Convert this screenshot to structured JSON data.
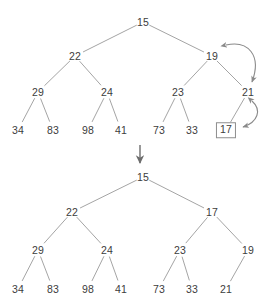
{
  "figure": {
    "background_color": "#ffffff",
    "edge_color": "#9a9a9a",
    "text_color": "#3c3c3c",
    "arrow_color": "#8a8a8a",
    "box_border_color": "#8e8e8e"
  },
  "trees": [
    {
      "id": "before",
      "name": "upper-tree",
      "nodes": [
        {
          "id": "u0",
          "label": "15",
          "x": 143,
          "y": 22,
          "level": 0,
          "boxed": false
        },
        {
          "id": "u1",
          "label": "22",
          "x": 75,
          "y": 56,
          "level": 1,
          "boxed": false
        },
        {
          "id": "u2",
          "label": "19",
          "x": 212,
          "y": 56,
          "level": 1,
          "boxed": false
        },
        {
          "id": "u3",
          "label": "29",
          "x": 38,
          "y": 92,
          "level": 2,
          "boxed": false
        },
        {
          "id": "u4",
          "label": "24",
          "x": 107,
          "y": 92,
          "level": 2,
          "boxed": false
        },
        {
          "id": "u5",
          "label": "23",
          "x": 178,
          "y": 92,
          "level": 2,
          "boxed": false
        },
        {
          "id": "u6",
          "label": "21",
          "x": 248,
          "y": 92,
          "level": 2,
          "boxed": false
        },
        {
          "id": "u7",
          "label": "34",
          "x": 18,
          "y": 130,
          "level": 3,
          "boxed": false
        },
        {
          "id": "u8",
          "label": "83",
          "x": 53,
          "y": 130,
          "level": 3,
          "boxed": false
        },
        {
          "id": "u9",
          "label": "98",
          "x": 88,
          "y": 130,
          "level": 3,
          "boxed": false
        },
        {
          "id": "u10",
          "label": "41",
          "x": 121,
          "y": 130,
          "level": 3,
          "boxed": false
        },
        {
          "id": "u11",
          "label": "73",
          "x": 159,
          "y": 130,
          "level": 3,
          "boxed": false
        },
        {
          "id": "u12",
          "label": "33",
          "x": 192,
          "y": 130,
          "level": 3,
          "boxed": false
        },
        {
          "id": "u13",
          "label": "17",
          "x": 226,
          "y": 130,
          "level": 3,
          "boxed": true
        }
      ],
      "edges": [
        [
          "u0",
          "u1"
        ],
        [
          "u0",
          "u2"
        ],
        [
          "u1",
          "u3"
        ],
        [
          "u1",
          "u4"
        ],
        [
          "u2",
          "u5"
        ],
        [
          "u2",
          "u6"
        ],
        [
          "u3",
          "u7"
        ],
        [
          "u3",
          "u8"
        ],
        [
          "u4",
          "u9"
        ],
        [
          "u4",
          "u10"
        ],
        [
          "u5",
          "u11"
        ],
        [
          "u5",
          "u12"
        ],
        [
          "u6",
          "u13"
        ]
      ]
    },
    {
      "id": "after",
      "name": "lower-tree",
      "nodes": [
        {
          "id": "l0",
          "label": "15",
          "x": 143,
          "y": 177,
          "level": 0,
          "boxed": false
        },
        {
          "id": "l1",
          "label": "22",
          "x": 72,
          "y": 212,
          "level": 1,
          "boxed": false
        },
        {
          "id": "l2",
          "label": "17",
          "x": 212,
          "y": 212,
          "level": 1,
          "boxed": false
        },
        {
          "id": "l3",
          "label": "29",
          "x": 38,
          "y": 250,
          "level": 2,
          "boxed": false
        },
        {
          "id": "l4",
          "label": "24",
          "x": 107,
          "y": 250,
          "level": 2,
          "boxed": false
        },
        {
          "id": "l5",
          "label": "23",
          "x": 180,
          "y": 250,
          "level": 2,
          "boxed": false
        },
        {
          "id": "l6",
          "label": "19",
          "x": 248,
          "y": 250,
          "level": 2,
          "boxed": false
        },
        {
          "id": "l7",
          "label": "34",
          "x": 18,
          "y": 289,
          "level": 3,
          "boxed": false
        },
        {
          "id": "l8",
          "label": "83",
          "x": 53,
          "y": 289,
          "level": 3,
          "boxed": false
        },
        {
          "id": "l9",
          "label": "98",
          "x": 88,
          "y": 289,
          "level": 3,
          "boxed": false
        },
        {
          "id": "l10",
          "label": "41",
          "x": 121,
          "y": 289,
          "level": 3,
          "boxed": false
        },
        {
          "id": "l11",
          "label": "73",
          "x": 159,
          "y": 289,
          "level": 3,
          "boxed": false
        },
        {
          "id": "l12",
          "label": "33",
          "x": 192,
          "y": 289,
          "level": 3,
          "boxed": false
        },
        {
          "id": "l13",
          "label": "21",
          "x": 226,
          "y": 289,
          "level": 3,
          "boxed": false
        }
      ],
      "edges": [
        [
          "l0",
          "l1"
        ],
        [
          "l0",
          "l2"
        ],
        [
          "l1",
          "l3"
        ],
        [
          "l1",
          "l4"
        ],
        [
          "l2",
          "l5"
        ],
        [
          "l2",
          "l6"
        ],
        [
          "l3",
          "l7"
        ],
        [
          "l3",
          "l8"
        ],
        [
          "l4",
          "l9"
        ],
        [
          "l4",
          "l10"
        ],
        [
          "l5",
          "l11"
        ],
        [
          "l5",
          "l12"
        ],
        [
          "l6",
          "l13"
        ]
      ]
    }
  ],
  "annotations": {
    "swap_arrows": [
      {
        "name": "swap-arrow-19-21",
        "from": "19",
        "to": "21",
        "double_headed": true
      },
      {
        "name": "swap-arrow-21-17",
        "from": "21",
        "to": "17",
        "double_headed": true
      }
    ],
    "transition_arrow": {
      "name": "transition-down-arrow",
      "direction": "down"
    }
  }
}
